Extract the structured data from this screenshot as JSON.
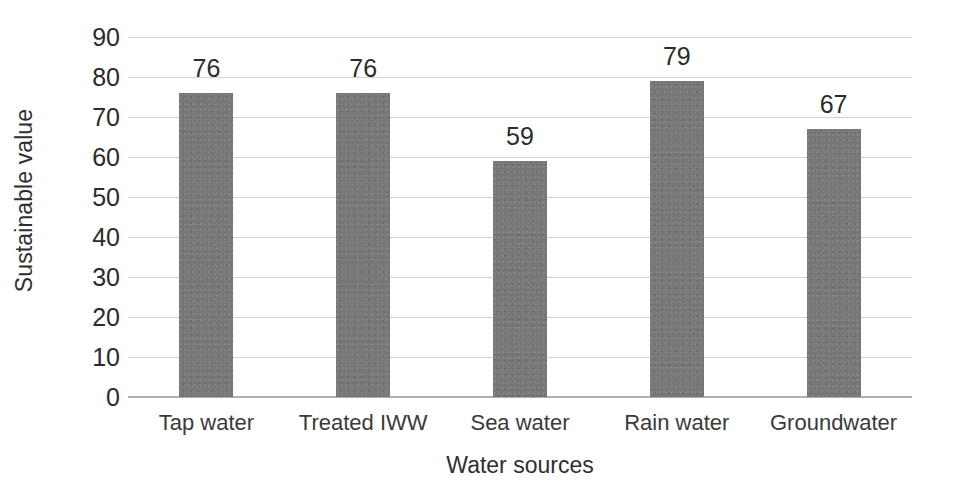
{
  "chart_data": {
    "type": "bar",
    "title": "",
    "categories": [
      "Tap water",
      "Treated IWW",
      "Sea water",
      "Rain water",
      "Groundwater"
    ],
    "values": [
      76,
      76,
      59,
      79,
      67
    ],
    "data_labels": [
      "76",
      "76",
      "59",
      "79",
      "67"
    ],
    "xlabel": "Water sources",
    "ylabel": "Sustainable value",
    "ylim": [
      0,
      90
    ],
    "ytick_step": 10,
    "yticks": [
      "90",
      "80",
      "70",
      "60",
      "50",
      "40",
      "30",
      "20",
      "10",
      "0"
    ],
    "ytick_values": [
      90,
      80,
      70,
      60,
      50,
      40,
      30,
      20,
      10,
      0
    ],
    "grid": "horizontal",
    "legend": "none",
    "series": [
      {
        "name": "Sustainable value",
        "values": [
          76,
          76,
          59,
          79,
          67
        ],
        "color": "#777777"
      }
    ],
    "colors": {
      "bar": "#777777",
      "gridline": "#c9c9c9",
      "axis": "#b0b0b0",
      "text": "#2b2b2b",
      "background": "#ffffff"
    }
  }
}
